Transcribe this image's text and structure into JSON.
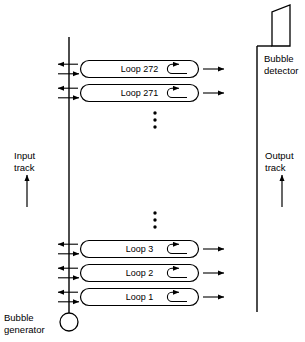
{
  "diagram": {
    "background_color": "#ffffff",
    "line_color": "#000000",
    "components": {
      "bubble_generator": {
        "label_line1": "Bubble",
        "label_line2": "generator",
        "shape": "circle",
        "cx": 69,
        "cy": 322,
        "r": 9
      },
      "bubble_detector": {
        "label_line1": "Bubble",
        "label_line2": "detector",
        "shape": "chamfered-rectangle"
      },
      "input_track": {
        "label_line1": "Input",
        "label_line2": "track",
        "direction": "up"
      },
      "output_track": {
        "label_line1": "Output",
        "label_line2": "track",
        "direction": "up"
      }
    },
    "loops": [
      {
        "label": "Loop 272",
        "cy": 69
      },
      {
        "label": "Loop 271",
        "cy": 93
      },
      {
        "label": "Loop 3",
        "cy": 249
      },
      {
        "label": "Loop 2",
        "cy": 273
      },
      {
        "label": "Loop 1",
        "cy": 297
      }
    ],
    "ellipses": [
      {
        "name": "upper-ellipsis",
        "cx": 155,
        "dots": 3,
        "y_start": 112
      },
      {
        "name": "lower-ellipsis",
        "cx": 155,
        "dots": 3,
        "y_start": 212
      }
    ]
  }
}
